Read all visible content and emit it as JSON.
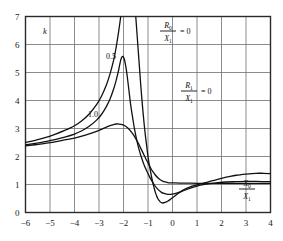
{
  "chart_data": {
    "type": "line",
    "title": "",
    "xlabel": "X0/X1",
    "ylabel": "k",
    "xlim": [
      -6,
      4
    ],
    "ylim": [
      0,
      7
    ],
    "grid": true,
    "xticks": [
      -6,
      -5,
      -4,
      -3,
      -2,
      -1,
      0,
      1,
      2,
      3,
      4
    ],
    "xtick_labels": [
      "−6",
      "−5",
      "−4",
      "−3",
      "−2",
      "−1",
      "0",
      "1",
      "2",
      "3",
      "4"
    ],
    "yticks": [
      0,
      1,
      2,
      3,
      4,
      5,
      6,
      7
    ],
    "ytick_labels": [
      "0",
      "1",
      "2",
      "3",
      "4",
      "5",
      "6",
      "7"
    ],
    "legend_position": "inline-annotations",
    "annotations": [
      {
        "name": "r0-over-x1",
        "numerator": "R",
        "numerator_sub": "0",
        "denominator": "X",
        "denominator_sub": "1",
        "equals": "= 0",
        "x": 168,
        "y": 30
      },
      {
        "name": "r1-over-x1",
        "numerator": "R",
        "numerator_sub": "1",
        "denominator": "X",
        "denominator_sub": "1",
        "equals": "= 0",
        "x": 189,
        "y": 90
      },
      {
        "name": "x-axis-title",
        "numerator": "X",
        "numerator_sub": "0",
        "denominator": "X",
        "denominator_sub": "1",
        "equals": "",
        "x": 247,
        "y": 188
      }
    ],
    "series": [
      {
        "name": "R0/X1 = 0",
        "label": "",
        "color": "#111111",
        "asymptote_x": -1.78,
        "points": [
          [
            -6.0,
            2.5
          ],
          [
            -5.6,
            2.58
          ],
          [
            -5.2,
            2.67
          ],
          [
            -4.8,
            2.79
          ],
          [
            -4.4,
            2.93
          ],
          [
            -4.0,
            3.1
          ],
          [
            -3.7,
            3.28
          ],
          [
            -3.4,
            3.52
          ],
          [
            -3.1,
            3.85
          ],
          [
            -2.9,
            4.15
          ],
          [
            -2.7,
            4.55
          ],
          [
            -2.55,
            4.95
          ],
          [
            -2.4,
            5.45
          ],
          [
            -2.3,
            5.9
          ],
          [
            -2.2,
            6.45
          ],
          [
            -2.1,
            7.1
          ],
          [
            -2.05,
            7.6
          ]
        ],
        "points_right": [
          [
            -1.55,
            7.6
          ],
          [
            -1.5,
            7.0
          ],
          [
            -1.45,
            6.4
          ],
          [
            -1.4,
            5.8
          ],
          [
            -1.35,
            5.2
          ],
          [
            -1.3,
            4.6
          ],
          [
            -1.25,
            4.05
          ],
          [
            -1.2,
            3.55
          ],
          [
            -1.15,
            3.1
          ],
          [
            -1.1,
            2.7
          ],
          [
            -1.05,
            2.35
          ],
          [
            -1.0,
            2.0
          ],
          [
            -0.95,
            1.72
          ],
          [
            -0.9,
            1.48
          ],
          [
            -0.85,
            1.25
          ],
          [
            -0.8,
            1.05
          ],
          [
            -0.75,
            0.88
          ],
          [
            -0.7,
            0.72
          ],
          [
            -0.65,
            0.6
          ],
          [
            -0.6,
            0.5
          ],
          [
            -0.55,
            0.43
          ],
          [
            -0.5,
            0.38
          ],
          [
            -0.45,
            0.35
          ],
          [
            -0.4,
            0.34
          ],
          [
            -0.3,
            0.36
          ],
          [
            -0.2,
            0.4
          ],
          [
            -0.1,
            0.46
          ],
          [
            0.0,
            0.53
          ],
          [
            0.2,
            0.66
          ],
          [
            0.4,
            0.78
          ],
          [
            0.6,
            0.87
          ],
          [
            0.8,
            0.94
          ],
          [
            1.0,
            0.99
          ],
          [
            1.2,
            1.03
          ],
          [
            1.4,
            1.08
          ],
          [
            1.7,
            1.15
          ],
          [
            2.0,
            1.22
          ],
          [
            2.3,
            1.28
          ],
          [
            2.6,
            1.33
          ],
          [
            3.0,
            1.37
          ],
          [
            3.4,
            1.4
          ],
          [
            3.7,
            1.4
          ],
          [
            4.0,
            1.39
          ]
        ]
      },
      {
        "name": "0.5",
        "label": "0.5",
        "label_x": 111,
        "label_y": 59,
        "color": "#111111",
        "asymptote_x": null,
        "points": [
          [
            -6.0,
            2.42
          ],
          [
            -5.6,
            2.47
          ],
          [
            -5.2,
            2.53
          ],
          [
            -4.8,
            2.6
          ],
          [
            -4.4,
            2.69
          ],
          [
            -4.0,
            2.8
          ],
          [
            -3.7,
            2.92
          ],
          [
            -3.4,
            3.08
          ],
          [
            -3.1,
            3.3
          ],
          [
            -2.9,
            3.5
          ],
          [
            -2.7,
            3.78
          ],
          [
            -2.55,
            4.05
          ],
          [
            -2.4,
            4.42
          ],
          [
            -2.3,
            4.72
          ],
          [
            -2.2,
            5.08
          ],
          [
            -2.15,
            5.3
          ],
          [
            -2.1,
            5.48
          ],
          [
            -2.05,
            5.57
          ],
          [
            -2.0,
            5.55
          ],
          [
            -1.95,
            5.42
          ],
          [
            -1.9,
            5.18
          ],
          [
            -1.85,
            4.88
          ],
          [
            -1.8,
            4.52
          ],
          [
            -1.75,
            4.15
          ],
          [
            -1.7,
            3.8
          ],
          [
            -1.62,
            3.35
          ],
          [
            -1.55,
            2.98
          ],
          [
            -1.45,
            2.55
          ],
          [
            -1.35,
            2.2
          ],
          [
            -1.25,
            1.92
          ],
          [
            -1.15,
            1.68
          ],
          [
            -1.05,
            1.48
          ],
          [
            -0.95,
            1.3
          ],
          [
            -0.85,
            1.14
          ],
          [
            -0.75,
            1.0
          ],
          [
            -0.65,
            0.88
          ],
          [
            -0.55,
            0.79
          ],
          [
            -0.45,
            0.72
          ],
          [
            -0.35,
            0.68
          ],
          [
            -0.25,
            0.66
          ],
          [
            -0.15,
            0.65
          ],
          [
            0.0,
            0.66
          ],
          [
            0.2,
            0.7
          ],
          [
            0.4,
            0.76
          ],
          [
            0.6,
            0.83
          ],
          [
            0.8,
            0.89
          ],
          [
            1.0,
            0.94
          ],
          [
            1.2,
            0.99
          ],
          [
            1.5,
            1.03
          ],
          [
            1.8,
            1.06
          ],
          [
            2.2,
            1.09
          ],
          [
            2.6,
            1.1
          ],
          [
            3.0,
            1.11
          ],
          [
            3.4,
            1.11
          ],
          [
            4.0,
            1.1
          ]
        ],
        "points_right": []
      },
      {
        "name": "1.0",
        "label": "1.0",
        "label_x": 93,
        "label_y": 117,
        "color": "#111111",
        "asymptote_x": null,
        "points": [
          [
            -6.0,
            2.38
          ],
          [
            -5.6,
            2.42
          ],
          [
            -5.2,
            2.47
          ],
          [
            -4.8,
            2.52
          ],
          [
            -4.4,
            2.59
          ],
          [
            -4.0,
            2.66
          ],
          [
            -3.7,
            2.73
          ],
          [
            -3.4,
            2.81
          ],
          [
            -3.1,
            2.9
          ],
          [
            -2.9,
            2.97
          ],
          [
            -2.7,
            3.05
          ],
          [
            -2.55,
            3.1
          ],
          [
            -2.4,
            3.14
          ],
          [
            -2.3,
            3.16
          ],
          [
            -2.2,
            3.16
          ],
          [
            -2.1,
            3.15
          ],
          [
            -2.0,
            3.12
          ],
          [
            -1.9,
            3.07
          ],
          [
            -1.8,
            3.0
          ],
          [
            -1.7,
            2.9
          ],
          [
            -1.6,
            2.78
          ],
          [
            -1.5,
            2.64
          ],
          [
            -1.4,
            2.48
          ],
          [
            -1.3,
            2.3
          ],
          [
            -1.2,
            2.12
          ],
          [
            -1.1,
            1.94
          ],
          [
            -1.0,
            1.77
          ],
          [
            -0.9,
            1.6
          ],
          [
            -0.8,
            1.46
          ],
          [
            -0.7,
            1.34
          ],
          [
            -0.6,
            1.24
          ],
          [
            -0.5,
            1.17
          ],
          [
            -0.4,
            1.12
          ],
          [
            -0.3,
            1.09
          ],
          [
            -0.2,
            1.07
          ],
          [
            -0.1,
            1.06
          ],
          [
            0.0,
            1.06
          ],
          [
            0.3,
            1.05
          ],
          [
            0.6,
            1.05
          ],
          [
            1.0,
            1.04
          ],
          [
            1.5,
            1.04
          ],
          [
            2.0,
            1.04
          ],
          [
            2.5,
            1.04
          ],
          [
            3.0,
            1.04
          ],
          [
            3.5,
            1.04
          ],
          [
            4.0,
            1.04
          ]
        ],
        "points_right": []
      }
    ]
  }
}
